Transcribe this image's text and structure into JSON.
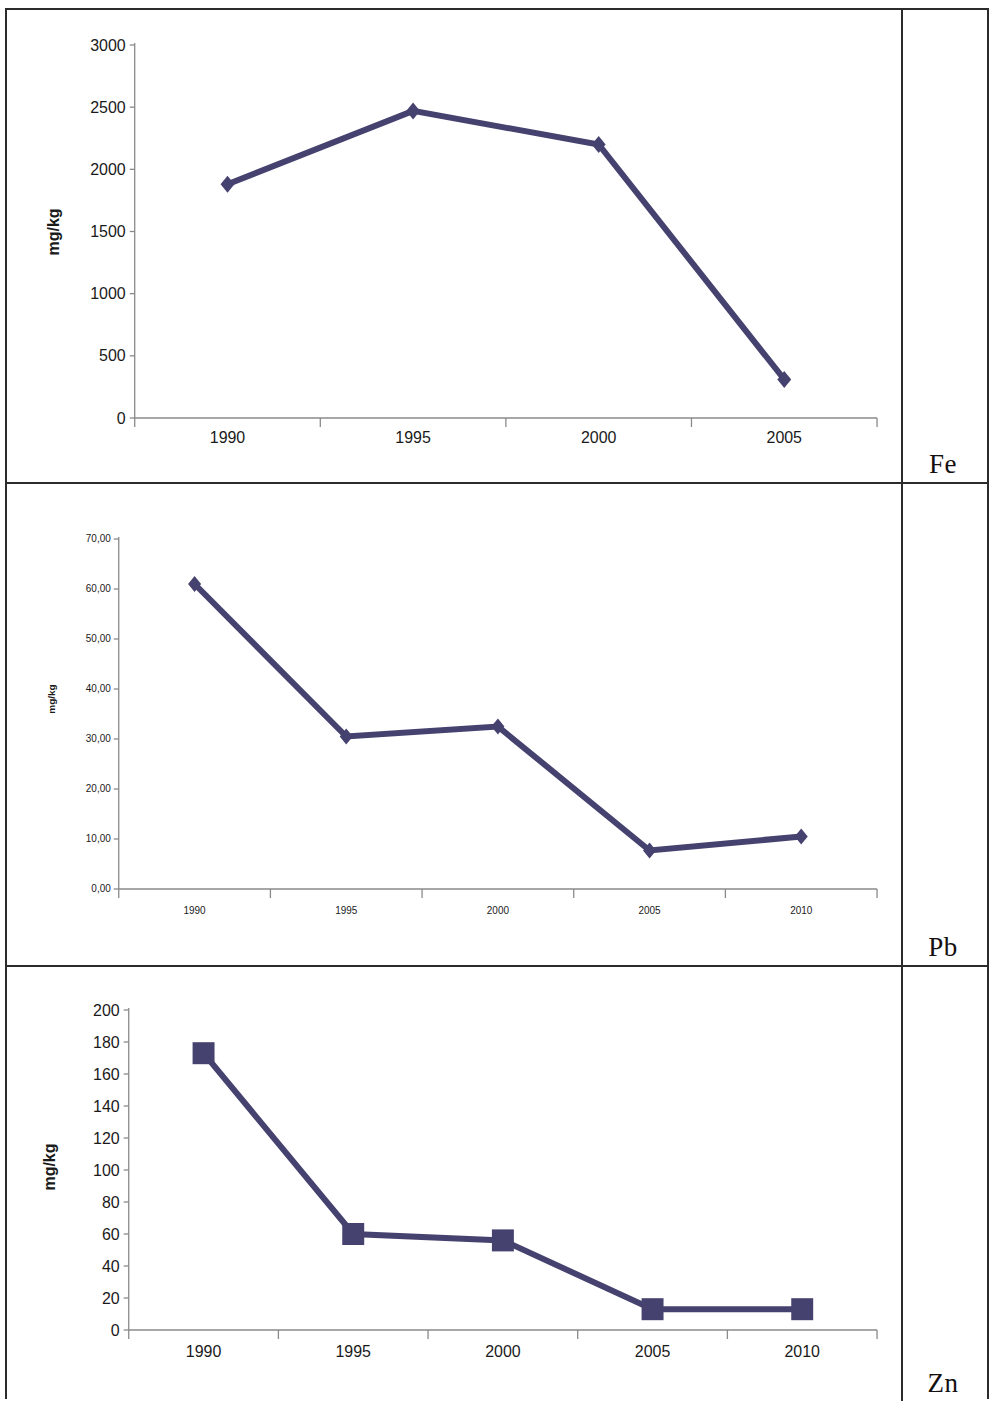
{
  "page": {
    "background_color": "#ffffff",
    "border_color": "#2b2b2b"
  },
  "series_color": "#46426f",
  "rows": [
    {
      "element_label": "Fe"
    },
    {
      "element_label": "Pb"
    },
    {
      "element_label": "Zn"
    }
  ],
  "chart_data": [
    {
      "type": "line",
      "element": "Fe",
      "title": "",
      "xlabel": "",
      "ylabel": "mg/kg",
      "categories": [
        "1990",
        "1995",
        "2000",
        "2005"
      ],
      "values": [
        1880,
        2470,
        2200,
        310
      ],
      "ytick_labels": [
        "0",
        "500",
        "1000",
        "1500",
        "2000",
        "2500",
        "3000"
      ],
      "ytick_values": [
        0,
        500,
        1000,
        1500,
        2000,
        2500,
        3000
      ],
      "ylim": [
        0,
        3000
      ],
      "grid": false,
      "legend": false,
      "marker": "diamond",
      "marker_size": 17,
      "line_width": 6,
      "color": "#46426f",
      "tick_font_size": 16,
      "axis_title_font_size": 16
    },
    {
      "type": "line",
      "element": "Pb",
      "title": "",
      "xlabel": "",
      "ylabel": "mg/kg",
      "categories": [
        "1990",
        "1995",
        "2000",
        "2005",
        "2010"
      ],
      "values": [
        61.0,
        30.5,
        32.5,
        7.7,
        10.5
      ],
      "ytick_labels": [
        "0,00",
        "10,00",
        "20,00",
        "30,00",
        "40,00",
        "50,00",
        "60,00",
        "70,00"
      ],
      "ytick_values": [
        0,
        10,
        20,
        30,
        40,
        50,
        60,
        70
      ],
      "ylim": [
        0,
        70
      ],
      "grid": false,
      "legend": false,
      "marker": "diamond",
      "marker_size": 16,
      "line_width": 6,
      "color": "#46426f",
      "tick_font_size": 10,
      "axis_title_font_size": 10
    },
    {
      "type": "line",
      "element": "Zn",
      "title": "",
      "xlabel": "",
      "ylabel": "mg/kg",
      "categories": [
        "1990",
        "1995",
        "2000",
        "2005",
        "2010"
      ],
      "values": [
        173,
        60,
        56,
        13,
        13
      ],
      "ytick_labels": [
        "0",
        "20",
        "40",
        "60",
        "80",
        "100",
        "120",
        "140",
        "160",
        "180",
        "200"
      ],
      "ytick_values": [
        0,
        20,
        40,
        60,
        80,
        100,
        120,
        140,
        160,
        180,
        200
      ],
      "ylim": [
        0,
        200
      ],
      "grid": false,
      "legend": false,
      "marker": "square",
      "marker_size": 22,
      "line_width": 6,
      "color": "#46426f",
      "tick_font_size": 16,
      "axis_title_font_size": 16
    }
  ]
}
